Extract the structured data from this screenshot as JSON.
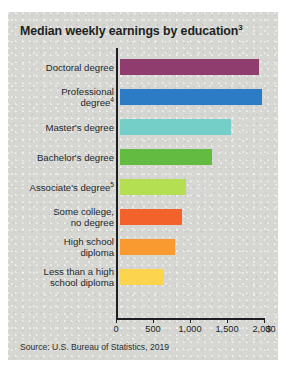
{
  "chart_data": {
    "type": "bar",
    "orientation": "horizontal",
    "title": "Median weekly earnings by education",
    "title_superscript": "3",
    "xlabel": "",
    "ylabel": "",
    "unit": "$",
    "xlim": [
      0,
      2000
    ],
    "grid": false,
    "legend": false,
    "tick_labels": [
      "0",
      "500",
      "1,000",
      "1,500",
      "2,000"
    ],
    "tick_values": [
      0,
      500,
      1000,
      1500,
      2000
    ],
    "source": "Source: U.S. Bureau of Statistics, 2019",
    "categories": [
      "Doctoral degree",
      "Professional degree",
      "Master's degree",
      "Bachelor's degree",
      "Associate's degree",
      "Some college,\nno degree",
      "High school\ndiploma",
      "Less than a high\nschool diploma"
    ],
    "values": [
      1885,
      1925,
      1497,
      1248,
      887,
      833,
      746,
      592
    ],
    "bars": [
      {
        "label": "Doctoral degree",
        "superscript": "",
        "value": 1885,
        "color": "#8e3d6e"
      },
      {
        "label": "Professional\ndegree",
        "superscript": "4",
        "value": 1925,
        "color": "#2b7cc4"
      },
      {
        "label": "Master's degree",
        "superscript": "",
        "value": 1497,
        "color": "#74cfc8"
      },
      {
        "label": "Bachelor's degree",
        "superscript": "",
        "value": 1248,
        "color": "#63bb42"
      },
      {
        "label": "Associate's degree",
        "superscript": "5",
        "value": 887,
        "color": "#b5df52"
      },
      {
        "label": "Some college,\nno degree",
        "superscript": "",
        "value": 833,
        "color": "#f4622c"
      },
      {
        "label": "High school\ndiploma",
        "superscript": "",
        "value": 746,
        "color": "#f99a31"
      },
      {
        "label": "Less than a high\nschool diploma",
        "superscript": "",
        "value": 592,
        "color": "#fcd44e"
      }
    ]
  },
  "card": {
    "background_color": "#d6d7d2",
    "text_color": "#1d1f22"
  }
}
